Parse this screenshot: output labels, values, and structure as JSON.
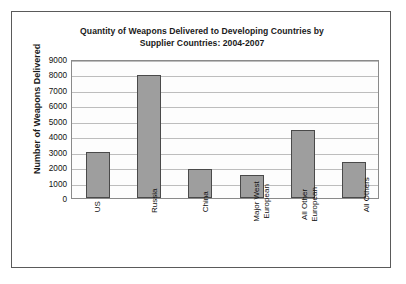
{
  "chart_data": {
    "type": "bar",
    "title": "Quantity of Weapons Delivered to Developing Countries by Supplier Countries: 2004-2007",
    "title_line1": "Quantity of Weapons Delivered to Developing Countries by",
    "title_line2": "Supplier Countries: 2004-2007",
    "xlabel": "",
    "ylabel": "Number of Weapons Delivered",
    "ylim": [
      0,
      9000
    ],
    "ytick_step": 1000,
    "ytick_labels": [
      "9000",
      "8000",
      "7000",
      "6000",
      "5000",
      "4000",
      "3000",
      "2000",
      "1000",
      "0"
    ],
    "grid": true,
    "legend": false,
    "categories": [
      {
        "label": "US",
        "line1": "US",
        "line2": ""
      },
      {
        "label": "Russia",
        "line1": "Russia",
        "line2": ""
      },
      {
        "label": "China",
        "line1": "China",
        "line2": ""
      },
      {
        "label": "Major West European",
        "line1": "Major West",
        "line2": "European"
      },
      {
        "label": "All Other European",
        "line1": "All Other",
        "line2": "European"
      },
      {
        "label": "All Others",
        "line1": "All Others",
        "line2": ""
      }
    ],
    "values": [
      3000,
      7950,
      1900,
      1500,
      4400,
      2350
    ],
    "bar_color": "#9e9e9e",
    "bar_edge_color": "#4a4a4a",
    "plot_background": "#fdfdfd",
    "gridline_color": "#bdbdbd",
    "frame_color": "#5a5a5a"
  }
}
